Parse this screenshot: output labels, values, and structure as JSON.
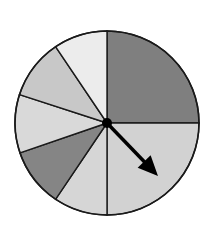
{
  "spinner": {
    "center": [
      107,
      123
    ],
    "radius": 92,
    "sectors": [
      {
        "name": "top-right-quarter",
        "start": -90,
        "end": 0,
        "color": "#7f7f7f"
      },
      {
        "name": "bottom-right-quarter",
        "start": 0,
        "end": 90,
        "color": "#d2d2d2"
      },
      {
        "name": "bottom-left-light",
        "start": 90,
        "end": 124,
        "color": "#d6d6d6"
      },
      {
        "name": "left-dark",
        "start": 124,
        "end": 161,
        "color": "#858585"
      },
      {
        "name": "left-light",
        "start": 161,
        "end": 198,
        "color": "#d9d9d9"
      },
      {
        "name": "upper-left-medium",
        "start": 198,
        "end": 236,
        "color": "#c8c8c8"
      },
      {
        "name": "top-left-lightest",
        "start": 236,
        "end": 270,
        "color": "#ececec"
      }
    ],
    "arrow": {
      "to": [
        158,
        176
      ],
      "color": "#000000"
    },
    "stroke_color": "#1a1a1a"
  }
}
